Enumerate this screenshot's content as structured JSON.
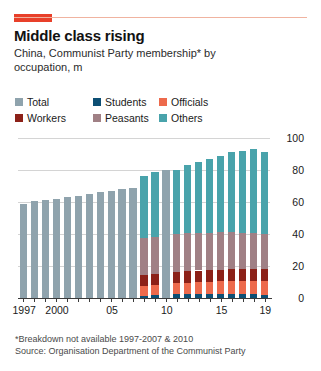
{
  "header": {
    "title": "Middle class rising",
    "subtitle": "China, Communist Party membership* by occupation, m"
  },
  "legend": {
    "rows": [
      [
        {
          "label": "Total",
          "color": "#8fa3ad"
        },
        {
          "label": "Students",
          "color": "#0d4f74"
        },
        {
          "label": "Officials",
          "color": "#ed6a4c"
        }
      ],
      [
        {
          "label": "Workers",
          "color": "#8c2118"
        },
        {
          "label": "Peasants",
          "color": "#a08085"
        },
        {
          "label": "Others",
          "color": "#49a3ab"
        }
      ]
    ]
  },
  "footnotes": [
    "*Breakdown not available 1997-2007 & 2010",
    "Source: Organisation Department of the Communist Party"
  ],
  "chart_data": {
    "type": "bar",
    "stacked": true,
    "title": "Middle class rising",
    "subtitle": "China, Communist Party membership* by occupation, m",
    "xlabel": "",
    "ylabel": "m",
    "ylim": [
      0,
      100
    ],
    "yticks": [
      0,
      20,
      40,
      60,
      80,
      100
    ],
    "grid": true,
    "legend_position": "top",
    "colors": {
      "Total": "#8fa3ad",
      "Students": "#0d4f74",
      "Officials": "#ed6a4c",
      "Workers": "#8c2118",
      "Peasants": "#a08085",
      "Others": "#49a3ab"
    },
    "categories": [
      1997,
      1998,
      1999,
      2000,
      2001,
      2002,
      2003,
      2004,
      2005,
      2006,
      2007,
      2008,
      2009,
      2010,
      2011,
      2012,
      2013,
      2014,
      2015,
      2016,
      2017,
      2018,
      2019
    ],
    "xtick_labels": [
      "1997",
      "2000",
      "05",
      "10",
      "15",
      "19"
    ],
    "xtick_categories": [
      1997,
      2000,
      2005,
      2010,
      2015,
      2019
    ],
    "series": [
      {
        "name": "Students",
        "values": [
          null,
          null,
          null,
          null,
          null,
          null,
          null,
          null,
          null,
          null,
          null,
          1.5,
          1.6,
          null,
          2.2,
          2.4,
          2.5,
          2.6,
          2.7,
          2.7,
          2.6,
          2.4,
          2.1
        ]
      },
      {
        "name": "Officials",
        "values": [
          null,
          null,
          null,
          null,
          null,
          null,
          null,
          null,
          null,
          null,
          null,
          6.2,
          6.5,
          null,
          7.0,
          7.2,
          7.4,
          7.6,
          7.8,
          8.0,
          8.2,
          8.4,
          8.6
        ]
      },
      {
        "name": "Workers",
        "values": [
          null,
          null,
          null,
          null,
          null,
          null,
          null,
          null,
          null,
          null,
          null,
          6.6,
          6.8,
          null,
          7.2,
          7.3,
          7.3,
          7.3,
          7.3,
          7.3,
          7.3,
          7.3,
          7.3
        ]
      },
      {
        "name": "Peasants",
        "values": [
          null,
          null,
          null,
          null,
          null,
          null,
          null,
          null,
          null,
          null,
          null,
          23.0,
          23.2,
          null,
          23.5,
          23.6,
          23.5,
          23.4,
          23.3,
          23.1,
          22.8,
          22.4,
          21.8
        ]
      },
      {
        "name": "Others",
        "values": [
          null,
          null,
          null,
          null,
          null,
          null,
          null,
          null,
          null,
          null,
          null,
          38.7,
          40.9,
          null,
          40.1,
          42.5,
          44.3,
          46.1,
          47.9,
          49.9,
          51.1,
          52.5,
          51.2
        ]
      },
      {
        "name": "Total",
        "values": [
          59.0,
          60.4,
          61.4,
          62.0,
          63.0,
          64.0,
          65.0,
          66.0,
          67.0,
          68.0,
          69.0,
          76.0,
          79.0,
          80.0,
          80.0,
          83.0,
          85.0,
          87.0,
          88.0,
          89.0,
          89.5,
          90.0,
          91.0
        ]
      }
    ],
    "note": "1997-2007 and 2010 show Total only; 2008-2009 and 2011-2019 are broken down by occupation"
  }
}
